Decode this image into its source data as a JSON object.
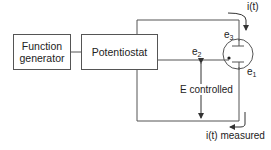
{
  "diagram": {
    "blocks": [
      {
        "id": "function-generator",
        "label": "Function generator"
      },
      {
        "id": "potentiostat",
        "label": "Potentiostat"
      }
    ],
    "electrodes": [
      {
        "id": "e3",
        "base": "e",
        "sub": "3"
      },
      {
        "id": "e2",
        "base": "e",
        "sub": "2"
      },
      {
        "id": "e1",
        "base": "e",
        "sub": "1"
      }
    ],
    "labels": {
      "current_in": "i(t)",
      "potential": "E controlled",
      "current_out": "i(t) measured"
    },
    "colors": {
      "line": "#555555",
      "text": "#222222",
      "background": "#ffffff"
    }
  }
}
